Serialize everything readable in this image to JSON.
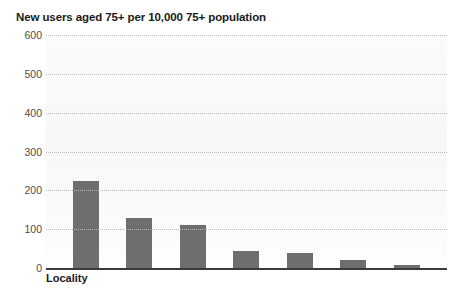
{
  "chart_data": {
    "type": "bar",
    "title": "New users aged 75+ per 10,000 75+ population",
    "xlabel": "Locality",
    "ylabel": "",
    "categories": [
      "1",
      "2",
      "3",
      "4",
      "5",
      "6",
      "7"
    ],
    "values": [
      225,
      130,
      110,
      45,
      38,
      20,
      8
    ],
    "ylim": [
      0,
      600
    ],
    "yticks": [
      0,
      100,
      200,
      300,
      400,
      500,
      600
    ],
    "ytick_labels": [
      "0",
      "100",
      "200",
      "300",
      "400",
      "500",
      "600"
    ],
    "grid": true,
    "gridline_style": "dotted",
    "legend": "none",
    "bar_color": "#6e6e6e",
    "axis_color": "#3b3b3b",
    "grid_color": "#b9b9b9",
    "title_color": "#1a1a1a",
    "tick_label_color": "#4d4d4d",
    "plot_background": "#f8f8f8"
  }
}
